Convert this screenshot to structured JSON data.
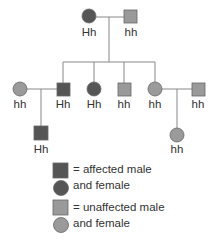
{
  "colors": {
    "affected": "#555555",
    "unaffected": "#9a9a9a",
    "line": "#888888",
    "stroke": "#666666"
  },
  "pedigree": {
    "generation1": [
      {
        "id": "g1-mother",
        "sex": "female",
        "affected": true,
        "genotype": "Hh"
      },
      {
        "id": "g1-father",
        "sex": "male",
        "affected": false,
        "genotype": "hh"
      }
    ],
    "generation2": [
      {
        "id": "g2-spouse-left",
        "sex": "female",
        "affected": false,
        "genotype": "hh"
      },
      {
        "id": "g2-son-1",
        "sex": "male",
        "affected": true,
        "genotype": "Hh"
      },
      {
        "id": "g2-daughter-1",
        "sex": "female",
        "affected": true,
        "genotype": "Hh"
      },
      {
        "id": "g2-son-2",
        "sex": "male",
        "affected": false,
        "genotype": "hh"
      },
      {
        "id": "g2-daughter-2",
        "sex": "female",
        "affected": false,
        "genotype": "hh"
      },
      {
        "id": "g2-spouse-right",
        "sex": "male",
        "affected": false,
        "genotype": "hh"
      }
    ],
    "generation3": [
      {
        "id": "g3-son",
        "sex": "male",
        "affected": true,
        "genotype": "Hh"
      },
      {
        "id": "g3-daughter",
        "sex": "female",
        "affected": false,
        "genotype": "hh"
      }
    ]
  },
  "legend": {
    "affected_line1": "= affected male",
    "affected_line2": "and female",
    "unaffected_line1": "= unaffected male",
    "unaffected_line2": "and female"
  }
}
